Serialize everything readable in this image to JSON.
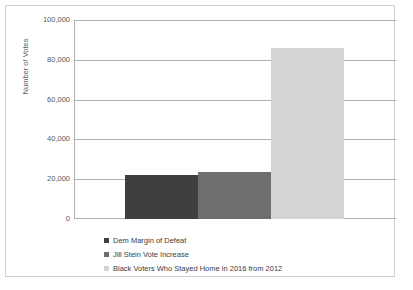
{
  "chart_data": {
    "type": "bar",
    "title": "",
    "subtitle": "",
    "xlabel": "",
    "ylabel": "Number of Votes",
    "ylim": [
      0,
      100000
    ],
    "ytick_labels": [
      "0",
      "20,000",
      "40,000",
      "60,000",
      "80,000",
      "100,000"
    ],
    "ytick_values": [
      0,
      20000,
      40000,
      60000,
      80000,
      100000
    ],
    "grid": true,
    "legend_position": "bottom-left",
    "categories": [
      "Dem Margin of Defeat",
      "Jill Stein Vote Increase",
      "Black Voters Who Stayed Home in 2016 from 2012"
    ],
    "values": [
      22000,
      23500,
      86000
    ],
    "colors": [
      "#3f3f3f",
      "#6e6e6e",
      "#d4d4d4"
    ],
    "series": [
      {
        "name": "Number of Votes",
        "values": [
          22000,
          23500,
          86000
        ]
      }
    ]
  },
  "legend": {
    "items": [
      {
        "label": "Dem Margin of Defeat",
        "color": "#3f3f3f"
      },
      {
        "label": "Jill Stein Vote Increase",
        "color": "#6e6e6e"
      },
      {
        "label": "Black Voters Who Stayed Home in 2016 from 2012",
        "color": "#d4d4d4"
      }
    ]
  },
  "style": {
    "grid_color": "#b0b0b0",
    "frame_color": "#cfcfcf",
    "text_color": "#595959",
    "background": "#ffffff"
  }
}
